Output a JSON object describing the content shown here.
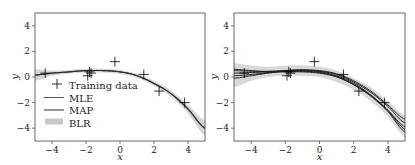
{
  "chart_data": [
    {
      "type": "line",
      "title": "",
      "xlabel": "x",
      "ylabel": "y",
      "xlim": [
        -5,
        5
      ],
      "ylim": [
        -5,
        5
      ],
      "xticks": [
        -4,
        -2,
        0,
        2,
        4
      ],
      "yticks": [
        -4,
        -2,
        0,
        2,
        4
      ],
      "grid": false,
      "legend_position": "lower left",
      "legend": [
        "Training data",
        "MLE",
        "MAP",
        "BLR"
      ],
      "training_data": {
        "x": [
          -4.4,
          -1.9,
          -1.8,
          -1.7,
          -0.3,
          1.4,
          2.3,
          3.8
        ],
        "y": [
          0.3,
          0.1,
          0.4,
          0.3,
          1.2,
          0.2,
          -1.1,
          -2.0
        ]
      },
      "series": [
        {
          "name": "MLE",
          "x": [
            -5,
            -4,
            -3,
            -2,
            -1,
            0,
            1,
            2,
            3,
            4,
            5
          ],
          "y": [
            0.15,
            0.3,
            0.4,
            0.5,
            0.5,
            0.4,
            0.1,
            -0.5,
            -1.3,
            -2.5,
            -4.0
          ]
        },
        {
          "name": "MAP",
          "x": [
            -5,
            -4,
            -3,
            -2,
            -1,
            0,
            1,
            2,
            3,
            4,
            5
          ],
          "y": [
            0.15,
            0.3,
            0.4,
            0.5,
            0.5,
            0.4,
            0.1,
            -0.5,
            -1.3,
            -2.5,
            -4.0
          ]
        },
        {
          "name": "BLR",
          "kind": "band",
          "x": [
            -5,
            -4,
            -3,
            -2,
            -1,
            0,
            1,
            2,
            3,
            4,
            5
          ],
          "lower": [
            -0.3,
            0.1,
            0.25,
            0.35,
            0.35,
            0.25,
            -0.05,
            -0.7,
            -1.55,
            -2.85,
            -4.6
          ],
          "upper": [
            0.6,
            0.5,
            0.55,
            0.65,
            0.65,
            0.55,
            0.25,
            -0.3,
            -1.05,
            -2.15,
            -3.4
          ]
        }
      ]
    },
    {
      "type": "line",
      "title": "",
      "xlabel": "x",
      "ylabel": "y",
      "xlim": [
        -5,
        5
      ],
      "ylim": [
        -5,
        5
      ],
      "xticks": [
        -4,
        -2,
        0,
        2,
        4
      ],
      "yticks": [
        -4,
        -2,
        0,
        2,
        4
      ],
      "grid": false,
      "training_data": {
        "x": [
          -4.4,
          -1.9,
          -1.8,
          -1.7,
          -0.3,
          1.4,
          2.3,
          3.8
        ],
        "y": [
          0.3,
          0.1,
          0.4,
          0.3,
          1.2,
          0.2,
          -1.1,
          -2.0
        ]
      },
      "series": [
        {
          "name": "posterior band",
          "kind": "band",
          "x": [
            -5,
            -4,
            -3,
            -2,
            -1,
            0,
            1,
            2,
            3,
            4,
            5
          ],
          "lower": [
            -0.8,
            -0.3,
            0.0,
            0.1,
            0.1,
            0.0,
            -0.4,
            -1.0,
            -1.9,
            -3.1,
            -4.7
          ],
          "upper": [
            1.1,
            0.9,
            0.8,
            0.9,
            0.9,
            0.8,
            0.5,
            -0.1,
            -0.8,
            -1.9,
            -3.0
          ]
        },
        {
          "name": "sample 1",
          "x": [
            -5,
            -4,
            -3,
            -2,
            -1,
            0,
            1,
            2,
            3,
            4,
            5
          ],
          "y": [
            0.5,
            0.45,
            0.45,
            0.5,
            0.55,
            0.45,
            0.2,
            -0.4,
            -1.2,
            -2.3,
            -3.6
          ]
        },
        {
          "name": "sample 2",
          "x": [
            -5,
            -4,
            -3,
            -2,
            -1,
            0,
            1,
            2,
            3,
            4,
            5
          ],
          "y": [
            -0.1,
            0.1,
            0.3,
            0.45,
            0.5,
            0.4,
            0.1,
            -0.5,
            -1.4,
            -2.6,
            -4.1
          ]
        },
        {
          "name": "sample 3",
          "x": [
            -5,
            -4,
            -3,
            -2,
            -1,
            0,
            1,
            2,
            3,
            4,
            5
          ],
          "y": [
            0.3,
            0.35,
            0.4,
            0.45,
            0.45,
            0.35,
            0.05,
            -0.6,
            -1.5,
            -2.7,
            -4.3
          ]
        },
        {
          "name": "sample 4",
          "x": [
            -5,
            -4,
            -3,
            -2,
            -1,
            0,
            1,
            2,
            3,
            4,
            5
          ],
          "y": [
            0.1,
            0.2,
            0.35,
            0.5,
            0.55,
            0.5,
            0.25,
            -0.3,
            -1.1,
            -2.2,
            -3.3
          ]
        },
        {
          "name": "sample 5",
          "x": [
            -5,
            -4,
            -3,
            -2,
            -1,
            0,
            1,
            2,
            3,
            4,
            5
          ],
          "y": [
            0.6,
            0.5,
            0.4,
            0.4,
            0.4,
            0.3,
            0.0,
            -0.6,
            -1.45,
            -2.6,
            -3.9
          ]
        }
      ]
    }
  ]
}
